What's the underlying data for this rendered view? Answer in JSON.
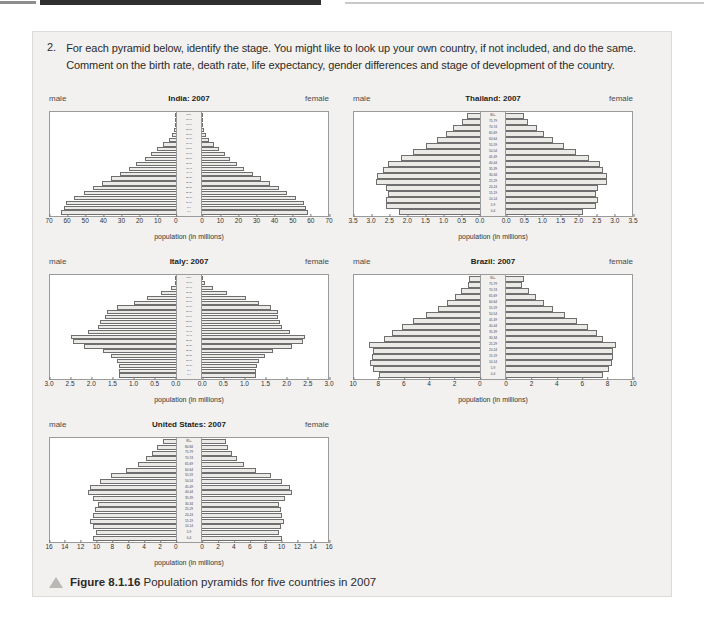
{
  "question": {
    "number": "2.",
    "text": "For each pyramid below, identify the stage. You might like to look up your own country, if not included, and do the same. Comment on the birth rate, death rate, life expectancy, gender differences and stage of development of the country."
  },
  "labels": {
    "male": "male",
    "female": "female",
    "axis_title": "population (in millions)"
  },
  "caption": {
    "figure_number": "Figure 8.1.16",
    "text": "Population pyramids for five countries in 2007",
    "icon": "triangle-icon"
  },
  "chart_data": [
    {
      "id": "india",
      "type": "bar",
      "title": "India: 2007",
      "subtype": "population-pyramid",
      "xlabel": "population (in millions)",
      "ylabel": "age group",
      "xlim": [
        0,
        70
      ],
      "ticks": [
        70,
        60,
        50,
        40,
        30,
        20,
        10,
        0,
        0,
        10,
        20,
        30,
        40,
        50,
        60,
        70
      ],
      "half_ticks": [
        0,
        10,
        20,
        30,
        40,
        50,
        60,
        70
      ],
      "categories": [
        "0-4",
        "5-9",
        "10-14",
        "15-19",
        "20-24",
        "25-29",
        "30-34",
        "35-39",
        "40-44",
        "45-49",
        "50-54",
        "55-59",
        "60-64",
        "65-69",
        "70-74",
        "75-79",
        "80-84",
        "85-89",
        "90-94",
        "95-99",
        "100+"
      ],
      "series": [
        {
          "name": "male",
          "values": [
            64.0,
            62.5,
            61.0,
            56.5,
            51.0,
            46.0,
            41.0,
            36.0,
            31.0,
            26.0,
            22.0,
            17.5,
            14.0,
            10.5,
            7.0,
            4.0,
            2.0,
            0.9,
            0.3,
            0.1,
            0.03
          ]
        },
        {
          "name": "female",
          "values": [
            59.0,
            58.0,
            56.5,
            52.0,
            47.0,
            43.0,
            38.0,
            33.0,
            28.5,
            23.5,
            19.5,
            15.5,
            12.5,
            9.5,
            6.5,
            3.8,
            2.0,
            0.9,
            0.3,
            0.1,
            0.03
          ]
        }
      ]
    },
    {
      "id": "thailand",
      "type": "bar",
      "title": "Thailand: 2007",
      "subtype": "population-pyramid",
      "xlabel": "population (in millions)",
      "ylabel": "age group",
      "xlim": [
        0,
        3.5
      ],
      "half_ticks": [
        "0.0",
        "0.5",
        "1.0",
        "1.5",
        "2.0",
        "2.5",
        "3.0",
        "3.5"
      ],
      "categories": [
        "0-4",
        "5-9",
        "10-14",
        "15-19",
        "20-24",
        "25-29",
        "30-34",
        "35-39",
        "40-44",
        "45-49",
        "50-54",
        "55-59",
        "60-64",
        "65-69",
        "70-74",
        "75-79",
        "80+"
      ],
      "series": [
        {
          "name": "male",
          "values": [
            2.25,
            2.6,
            2.6,
            2.55,
            2.6,
            2.9,
            2.85,
            2.7,
            2.55,
            2.2,
            1.85,
            1.5,
            1.2,
            0.95,
            0.75,
            0.5,
            0.35
          ]
        },
        {
          "name": "female",
          "values": [
            2.15,
            2.5,
            2.55,
            2.5,
            2.55,
            2.8,
            2.8,
            2.7,
            2.6,
            2.3,
            1.95,
            1.6,
            1.3,
            1.05,
            0.85,
            0.6,
            0.5
          ]
        }
      ]
    },
    {
      "id": "italy",
      "type": "bar",
      "title": "Italy: 2007",
      "subtype": "population-pyramid",
      "xlabel": "population (in millions)",
      "ylabel": "age group",
      "xlim": [
        0,
        3.0
      ],
      "half_ticks": [
        "0.0",
        "0.5",
        "1.0",
        "1.5",
        "2.0",
        "2.5",
        "3.0"
      ],
      "categories": [
        "0-4",
        "5-9",
        "10-14",
        "15-19",
        "20-24",
        "25-29",
        "30-34",
        "35-39",
        "40-44",
        "45-49",
        "50-54",
        "55-59",
        "60-64",
        "65-69",
        "70-74",
        "75-79",
        "80-84",
        "85-89",
        "90-94",
        "95-99",
        "100+"
      ],
      "series": [
        {
          "name": "male",
          "values": [
            1.35,
            1.35,
            1.35,
            1.4,
            1.55,
            1.75,
            2.2,
            2.45,
            2.5,
            2.1,
            1.85,
            1.8,
            1.7,
            1.65,
            1.4,
            1.0,
            0.7,
            0.35,
            0.12,
            0.03,
            0.005
          ]
        },
        {
          "name": "female",
          "values": [
            1.28,
            1.28,
            1.3,
            1.35,
            1.5,
            1.7,
            2.15,
            2.4,
            2.45,
            2.1,
            1.9,
            1.85,
            1.8,
            1.8,
            1.65,
            1.35,
            1.05,
            0.6,
            0.25,
            0.06,
            0.01
          ]
        }
      ]
    },
    {
      "id": "brazil",
      "type": "bar",
      "title": "Brazil: 2007",
      "subtype": "population-pyramid",
      "xlabel": "population (in millions)",
      "ylabel": "age group",
      "xlim": [
        0,
        10
      ],
      "half_ticks": [
        0,
        2,
        4,
        6,
        8,
        10
      ],
      "categories": [
        "0-4",
        "5-9",
        "10-14",
        "15-19",
        "20-24",
        "25-29",
        "30-34",
        "35-39",
        "40-44",
        "45-49",
        "50-54",
        "55-59",
        "60-64",
        "65-69",
        "70-74",
        "75-79",
        "80+"
      ],
      "series": [
        {
          "name": "male",
          "values": [
            8.0,
            8.5,
            8.7,
            8.6,
            8.5,
            8.8,
            7.6,
            7.0,
            6.2,
            5.3,
            4.3,
            3.3,
            2.6,
            2.0,
            1.5,
            0.95,
            0.85
          ]
        },
        {
          "name": "female",
          "values": [
            7.7,
            8.2,
            8.45,
            8.5,
            8.5,
            8.7,
            7.7,
            7.2,
            6.5,
            5.6,
            4.7,
            3.7,
            3.0,
            2.4,
            1.8,
            1.25,
            1.4
          ]
        }
      ]
    },
    {
      "id": "united-states",
      "type": "bar",
      "title": "United States: 2007",
      "subtype": "population-pyramid",
      "xlabel": "population (in millions)",
      "ylabel": "age group",
      "xlim": [
        0,
        16
      ],
      "half_ticks": [
        0,
        2,
        4,
        6,
        8,
        10,
        12,
        14,
        16
      ],
      "categories": [
        "0-4",
        "5-9",
        "10-14",
        "15-19",
        "20-24",
        "25-29",
        "30-34",
        "35-39",
        "40-44",
        "45-49",
        "50-54",
        "55-59",
        "60-64",
        "65-69",
        "70-74",
        "75-79",
        "80-84",
        "85+"
      ],
      "series": [
        {
          "name": "male",
          "values": [
            10.6,
            10.2,
            10.5,
            10.9,
            10.5,
            10.3,
            9.9,
            10.6,
            11.2,
            10.9,
            9.7,
            8.3,
            6.3,
            4.8,
            3.8,
            3.1,
            2.4,
            1.7
          ]
        },
        {
          "name": "female",
          "values": [
            10.1,
            9.8,
            10.0,
            10.4,
            10.1,
            10.0,
            9.8,
            10.6,
            11.4,
            11.2,
            10.1,
            8.8,
            6.8,
            5.3,
            4.4,
            3.8,
            3.3,
            3.1
          ]
        }
      ]
    }
  ]
}
